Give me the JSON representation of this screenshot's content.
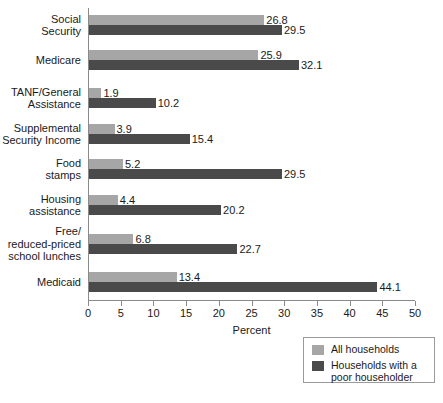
{
  "chart_data": {
    "type": "bar",
    "orientation": "horizontal",
    "title": "",
    "xlabel": "Percent",
    "ylabel": "",
    "xlim": [
      0,
      50
    ],
    "xticks": [
      0,
      5,
      10,
      15,
      20,
      25,
      30,
      35,
      40,
      45,
      50
    ],
    "xtick_labels": [
      "0",
      "5",
      "10",
      "15",
      "20",
      "25",
      "30",
      "35",
      "40",
      "45",
      "50"
    ],
    "grid": false,
    "legend_position": "bottom-right",
    "categories": [
      "Social\nSecurity",
      "Medicare",
      "TANF/General\nAssistance",
      "Supplemental\nSecurity Income",
      "Food\nstamps",
      "Housing\nassistance",
      "Free/\nreduced-priced\nschool lunches",
      "Medicaid"
    ],
    "series": [
      {
        "name": "All households",
        "color": "#a6a6a6",
        "values": [
          26.8,
          25.9,
          1.9,
          3.9,
          5.2,
          4.4,
          6.8,
          13.4
        ],
        "labels": [
          "26.8",
          "25.9",
          "1.9",
          "3.9",
          "5.2",
          "4.4",
          "6.8",
          "13.4"
        ]
      },
      {
        "name": "Households with a\npoor householder",
        "color": "#4a4a4a",
        "values": [
          29.5,
          32.1,
          10.2,
          15.4,
          29.5,
          20.2,
          22.7,
          44.1
        ],
        "labels": [
          "29.5",
          "32.1",
          "10.2",
          "15.4",
          "29.5",
          "20.2",
          "22.7",
          "44.1"
        ]
      }
    ]
  },
  "legend": {
    "items": [
      {
        "label": "All households",
        "color": "#a6a6a6"
      },
      {
        "label": "Households with a\npoor householder",
        "color": "#4a4a4a"
      }
    ]
  }
}
